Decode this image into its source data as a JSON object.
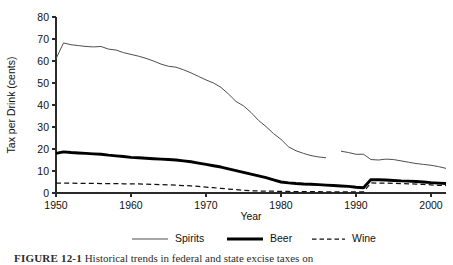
{
  "figure": {
    "caption_label": "FIGURE 12-1",
    "caption_text": "Historical trends in federal and state excise taxes on"
  },
  "chart_data": {
    "type": "line",
    "title": "",
    "xlabel": "Year",
    "ylabel": "Tax per Drink (cents)",
    "xlim": [
      1950,
      2002
    ],
    "ylim": [
      0,
      80
    ],
    "xticks": [
      1950,
      1960,
      1970,
      1980,
      1990,
      2000
    ],
    "yticks": [
      0,
      10,
      20,
      30,
      40,
      50,
      60,
      70,
      80
    ],
    "grid": false,
    "legend_position": "below",
    "series": [
      {
        "name": "Spirits",
        "style": "thin-solid",
        "color": "#4f4f4f",
        "x": [
          1950,
          1951,
          1952,
          1953,
          1954,
          1955,
          1956,
          1957,
          1958,
          1959,
          1960,
          1961,
          1962,
          1963,
          1964,
          1965,
          1966,
          1967,
          1968,
          1969,
          1970,
          1971,
          1972,
          1973,
          1974,
          1975,
          1976,
          1977,
          1978,
          1979,
          1980,
          1981,
          1982,
          1983,
          1984,
          1985,
          1986,
          1987,
          1988,
          1989,
          1990,
          1991,
          1992,
          1993,
          1994,
          1995,
          1996,
          1997,
          1998,
          1999,
          2000,
          2001,
          2002
        ],
        "values": [
          61.0,
          68.2,
          67.4,
          67.0,
          66.6,
          66.4,
          66.6,
          65.4,
          65.0,
          63.8,
          63.0,
          62.2,
          61.2,
          60.0,
          58.6,
          57.6,
          57.2,
          56.0,
          54.6,
          53.0,
          51.4,
          50.0,
          48.0,
          45.0,
          41.6,
          39.6,
          36.6,
          33.0,
          30.2,
          27.0,
          24.4,
          21.0,
          19.2,
          18.0,
          17.0,
          16.4,
          16.0,
          null,
          19.0,
          18.4,
          17.6,
          17.6,
          15.2,
          15.0,
          15.4,
          15.2,
          14.6,
          14.0,
          13.4,
          13.0,
          12.6,
          12.0,
          11.2
        ],
        "break_note": "line is interrupted between 1986 and 1988"
      },
      {
        "name": "Beer",
        "style": "thick-solid",
        "color": "#000000",
        "x": [
          1950,
          1951,
          1952,
          1953,
          1954,
          1955,
          1956,
          1957,
          1958,
          1959,
          1960,
          1961,
          1962,
          1963,
          1964,
          1965,
          1966,
          1967,
          1968,
          1969,
          1970,
          1971,
          1972,
          1973,
          1974,
          1975,
          1976,
          1977,
          1978,
          1979,
          1980,
          1981,
          1982,
          1983,
          1984,
          1985,
          1986,
          1987,
          1988,
          1989,
          1990,
          1991,
          1992,
          1993,
          1994,
          1995,
          1996,
          1997,
          1998,
          1999,
          2000,
          2001,
          2002
        ],
        "values": [
          18.0,
          18.7,
          18.4,
          18.2,
          18.0,
          17.8,
          17.6,
          17.2,
          16.9,
          16.6,
          16.2,
          16.0,
          15.8,
          15.6,
          15.4,
          15.2,
          15.0,
          14.6,
          14.2,
          13.6,
          13.0,
          12.4,
          11.8,
          11.0,
          10.2,
          9.4,
          8.6,
          7.8,
          7.0,
          6.0,
          5.0,
          4.6,
          4.3,
          4.1,
          4.0,
          3.8,
          3.6,
          3.4,
          3.2,
          3.0,
          2.6,
          2.4,
          6.1,
          6.0,
          5.9,
          5.7,
          5.5,
          5.4,
          5.2,
          5.0,
          4.7,
          4.5,
          4.3
        ]
      },
      {
        "name": "Wine",
        "style": "dashed",
        "color": "#111111",
        "x": [
          1950,
          1951,
          1952,
          1953,
          1954,
          1955,
          1956,
          1957,
          1958,
          1959,
          1960,
          1961,
          1962,
          1963,
          1964,
          1965,
          1966,
          1967,
          1968,
          1969,
          1970,
          1971,
          1972,
          1973,
          1974,
          1975,
          1976,
          1977,
          1978,
          1979,
          1980,
          1981,
          1982,
          1983,
          1984,
          1985,
          1986,
          1987,
          1988,
          1989,
          1990,
          1991,
          1992,
          1993,
          1994,
          1995,
          1996,
          1997,
          1998,
          1999,
          2000,
          2001,
          2002
        ],
        "values": [
          4.5,
          4.5,
          4.5,
          4.4,
          4.4,
          4.4,
          4.3,
          4.3,
          4.3,
          4.2,
          4.2,
          4.1,
          4.0,
          3.9,
          3.8,
          3.7,
          3.6,
          3.4,
          3.2,
          3.0,
          2.7,
          2.4,
          2.1,
          1.8,
          1.5,
          1.2,
          1.0,
          0.9,
          0.8,
          0.8,
          0.7,
          0.7,
          0.6,
          0.6,
          0.6,
          0.6,
          0.5,
          0.5,
          0.5,
          0.5,
          0.5,
          0.5,
          4.6,
          4.5,
          4.5,
          4.4,
          4.3,
          4.2,
          4.0,
          3.9,
          3.7,
          3.5,
          3.4
        ]
      }
    ],
    "legend": [
      "Spirits",
      "Beer",
      "Wine"
    ]
  }
}
